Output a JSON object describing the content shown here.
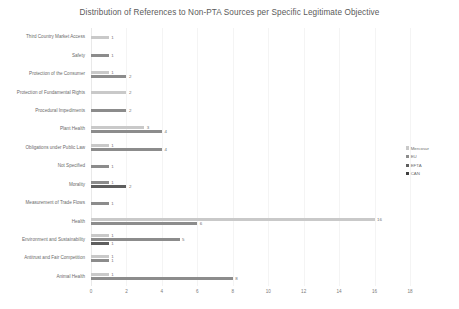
{
  "chart_data": {
    "type": "bar",
    "orientation": "horizontal",
    "title": "Distribution of References to Non-PTA Sources per Specific Legitimate Objective",
    "xlabel": "",
    "ylabel": "",
    "xlim": [
      0,
      18
    ],
    "xticks": [
      0,
      2,
      4,
      6,
      8,
      10,
      12,
      14,
      16,
      18
    ],
    "grid": true,
    "legend_position": "right",
    "categories": [
      "Third Country Market Access",
      "Safety",
      "Protection of the Consumer",
      "Protection of Fundamental Rights",
      "Procedural Impediments",
      "Plant Health",
      "Obligations under Public Law",
      "Not Specified",
      "Morality",
      "Measurement of Trade Flows",
      "Health",
      "Environment and Sustainability",
      "Antitrust and Fair Competition",
      "Animal Health"
    ],
    "series": [
      {
        "name": "Mercosur",
        "color": "#c9c9c9",
        "values": [
          1,
          null,
          1,
          2,
          null,
          3,
          1,
          null,
          null,
          null,
          16,
          1,
          1,
          1
        ]
      },
      {
        "name": "EU",
        "color": "#8c8c8c",
        "values": [
          null,
          1,
          2,
          null,
          2,
          4,
          4,
          1,
          1,
          1,
          6,
          5,
          1,
          8
        ]
      },
      {
        "name": "EFTA",
        "color": "#5e5e5e",
        "values": [
          null,
          null,
          null,
          null,
          null,
          null,
          null,
          null,
          2,
          null,
          null,
          1,
          null,
          null
        ]
      },
      {
        "name": "CAN",
        "color": "#404040",
        "values": [
          null,
          null,
          null,
          null,
          null,
          null,
          null,
          null,
          null,
          null,
          null,
          null,
          null,
          null
        ]
      }
    ],
    "bars": [
      {
        "category": "Third Country Market Access",
        "items": [
          {
            "series": "Mercosur",
            "value": 1,
            "label": "1"
          }
        ]
      },
      {
        "category": "Safety",
        "items": [
          {
            "series": "EU",
            "value": 1,
            "label": "1"
          }
        ]
      },
      {
        "category": "Protection of the Consumer",
        "items": [
          {
            "series": "Mercosur",
            "value": 1,
            "label": "1"
          },
          {
            "series": "EU",
            "value": 2,
            "label": "2"
          }
        ]
      },
      {
        "category": "Protection of Fundamental Rights",
        "items": [
          {
            "series": "Mercosur",
            "value": 2,
            "label": "2"
          }
        ]
      },
      {
        "category": "Procedural Impediments",
        "items": [
          {
            "series": "EU",
            "value": 2,
            "label": "2"
          }
        ]
      },
      {
        "category": "Plant Health",
        "items": [
          {
            "series": "Mercosur",
            "value": 3,
            "label": "3"
          },
          {
            "series": "EU",
            "value": 4,
            "label": "4"
          }
        ]
      },
      {
        "category": "Obligations under Public Law",
        "items": [
          {
            "series": "Mercosur",
            "value": 1,
            "label": "1"
          },
          {
            "series": "EU",
            "value": 4,
            "label": "4"
          }
        ]
      },
      {
        "category": "Not Specified",
        "items": [
          {
            "series": "EU",
            "value": 1,
            "label": "1"
          }
        ]
      },
      {
        "category": "Morality",
        "items": [
          {
            "series": "EU",
            "value": 1,
            "label": "1"
          },
          {
            "series": "EFTA",
            "value": 2,
            "label": "2"
          }
        ]
      },
      {
        "category": "Measurement of Trade Flows",
        "items": [
          {
            "series": "EU",
            "value": 1,
            "label": "1"
          }
        ]
      },
      {
        "category": "Health",
        "items": [
          {
            "series": "Mercosur",
            "value": 16,
            "label": "16"
          },
          {
            "series": "EU",
            "value": 6,
            "label": "6"
          }
        ]
      },
      {
        "category": "Environment and Sustainability",
        "items": [
          {
            "series": "Mercosur",
            "value": 1,
            "label": "1"
          },
          {
            "series": "EU",
            "value": 5,
            "label": "5"
          },
          {
            "series": "EFTA",
            "value": 1,
            "label": "1"
          }
        ]
      },
      {
        "category": "Antitrust and Fair Competition",
        "items": [
          {
            "series": "Mercosur",
            "value": 1,
            "label": "1"
          },
          {
            "series": "EU",
            "value": 1,
            "label": "1"
          }
        ]
      },
      {
        "category": "Animal Health",
        "items": [
          {
            "series": "Mercosur",
            "value": 1,
            "label": "1"
          },
          {
            "series": "EU",
            "value": 8,
            "label": "8"
          }
        ]
      }
    ]
  },
  "legend": {
    "items": [
      {
        "label": "Mercosur",
        "color": "#c9c9c9"
      },
      {
        "label": "EU",
        "color": "#8c8c8c"
      },
      {
        "label": "EFTA",
        "color": "#5e5e5e"
      },
      {
        "label": "CAN",
        "color": "#404040"
      }
    ]
  }
}
